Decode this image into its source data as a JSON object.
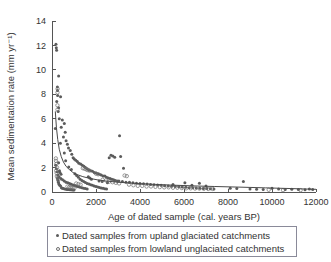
{
  "chart_data": {
    "type": "scatter",
    "title": "",
    "xlabel": "Age of dated sample (cal. years BP)",
    "ylabel": "Mean sedimentation rate (mm yr⁻¹)",
    "xlim": [
      0,
      12000
    ],
    "ylim": [
      0,
      14
    ],
    "xticks": [
      0,
      2000,
      4000,
      6000,
      8000,
      10000,
      12000
    ],
    "xticklabels": [
      "0",
      "2000",
      "4000",
      "6000",
      "8000",
      "10000",
      "12000"
    ],
    "yticks": [
      0,
      2,
      4,
      6,
      8,
      10,
      12,
      14
    ],
    "yticklabels": [
      "0",
      "2",
      "4",
      "6",
      "8",
      "10",
      "12",
      "14"
    ],
    "grid": false,
    "legend_position": "below-axes",
    "series": [
      {
        "name": "Dated samples from upland glaciated catchments",
        "marker": "filled-circle",
        "color": "#5b5b5b",
        "points": [
          [
            180,
            12.1
          ],
          [
            195,
            11.8
          ],
          [
            210,
            11.6
          ],
          [
            300,
            9.5
          ],
          [
            245,
            8.6
          ],
          [
            250,
            8.3
          ],
          [
            255,
            7.9
          ],
          [
            390,
            7.8
          ],
          [
            215,
            7.4
          ],
          [
            300,
            6.9
          ],
          [
            280,
            6.6
          ],
          [
            330,
            6.0
          ],
          [
            470,
            5.9
          ],
          [
            560,
            5.6
          ],
          [
            420,
            5.3
          ],
          [
            150,
            5.2
          ],
          [
            600,
            4.9
          ],
          [
            520,
            4.5
          ],
          [
            3070,
            4.6
          ],
          [
            640,
            4.2
          ],
          [
            380,
            4.0
          ],
          [
            700,
            3.9
          ],
          [
            750,
            3.6
          ],
          [
            830,
            3.4
          ],
          [
            560,
            3.2
          ],
          [
            900,
            3.1
          ],
          [
            2680,
            3.0
          ],
          [
            2760,
            2.95
          ],
          [
            2850,
            2.85
          ],
          [
            3120,
            2.9
          ],
          [
            2600,
            2.8
          ],
          [
            960,
            2.8
          ],
          [
            1010,
            2.7
          ],
          [
            1080,
            2.6
          ],
          [
            620,
            2.55
          ],
          [
            1150,
            2.5
          ],
          [
            300,
            2.4
          ],
          [
            1220,
            2.35
          ],
          [
            1300,
            2.3
          ],
          [
            170,
            2.2
          ],
          [
            1380,
            2.2
          ],
          [
            1450,
            2.1
          ],
          [
            760,
            2.05
          ],
          [
            1520,
            2.0
          ],
          [
            3250,
            1.95
          ],
          [
            200,
            1.9
          ],
          [
            1600,
            1.9
          ],
          [
            880,
            1.85
          ],
          [
            1680,
            1.8
          ],
          [
            1760,
            1.75
          ],
          [
            1840,
            1.7
          ],
          [
            240,
            1.65
          ],
          [
            1920,
            1.6
          ],
          [
            2000,
            1.55
          ],
          [
            1040,
            1.5
          ],
          [
            2080,
            1.5
          ],
          [
            2160,
            1.45
          ],
          [
            260,
            1.4
          ],
          [
            2240,
            1.4
          ],
          [
            1120,
            1.35
          ],
          [
            2320,
            1.3
          ],
          [
            2400,
            1.3
          ],
          [
            320,
            1.25
          ],
          [
            2480,
            1.2
          ],
          [
            1200,
            1.2
          ],
          [
            2560,
            1.15
          ],
          [
            2640,
            1.1
          ],
          [
            400,
            1.1
          ],
          [
            2720,
            1.05
          ],
          [
            1280,
            1.05
          ],
          [
            2800,
            1.0
          ],
          [
            480,
            1.0
          ],
          [
            2880,
            0.95
          ],
          [
            1360,
            0.95
          ],
          [
            2960,
            0.9
          ],
          [
            3040,
            0.9
          ],
          [
            560,
            0.9
          ],
          [
            3200,
            0.85
          ],
          [
            1440,
            0.85
          ],
          [
            3360,
            0.8
          ],
          [
            640,
            0.8
          ],
          [
            3520,
            0.8
          ],
          [
            1520,
            0.78
          ],
          [
            3680,
            0.75
          ],
          [
            720,
            0.75
          ],
          [
            3840,
            0.72
          ],
          [
            1600,
            0.7
          ],
          [
            4000,
            0.7
          ],
          [
            800,
            0.7
          ],
          [
            4160,
            0.68
          ],
          [
            1680,
            0.66
          ],
          [
            4320,
            0.65
          ],
          [
            880,
            0.64
          ],
          [
            4480,
            0.62
          ],
          [
            1760,
            0.6
          ],
          [
            4640,
            0.6
          ],
          [
            960,
            0.58
          ],
          [
            4800,
            0.57
          ],
          [
            1840,
            0.55
          ],
          [
            4960,
            0.55
          ],
          [
            1040,
            0.53
          ],
          [
            5120,
            0.52
          ],
          [
            1920,
            0.5
          ],
          [
            5280,
            0.5
          ],
          [
            1120,
            0.48
          ],
          [
            5440,
            0.47
          ],
          [
            2000,
            0.45
          ],
          [
            5600,
            0.45
          ],
          [
            1200,
            0.43
          ],
          [
            5760,
            0.42
          ],
          [
            2080,
            0.4
          ],
          [
            5920,
            0.4
          ],
          [
            1280,
            0.38
          ],
          [
            6080,
            0.38
          ],
          [
            2160,
            0.36
          ],
          [
            6240,
            0.35
          ],
          [
            1360,
            0.34
          ],
          [
            6400,
            0.34
          ],
          [
            2240,
            0.32
          ],
          [
            6560,
            0.32
          ],
          [
            1440,
            0.3
          ],
          [
            6720,
            0.3
          ],
          [
            2320,
            0.3
          ],
          [
            6880,
            0.28
          ],
          [
            1520,
            0.28
          ],
          [
            7040,
            0.28
          ],
          [
            2400,
            0.26
          ],
          [
            7200,
            0.26
          ],
          [
            1600,
            0.25
          ],
          [
            7360,
            0.25
          ],
          [
            2480,
            0.24
          ],
          [
            6040,
            0.75
          ],
          [
            6700,
            0.72
          ],
          [
            5500,
            0.62
          ],
          [
            6360,
            0.55
          ],
          [
            7000,
            0.5
          ],
          [
            8700,
            0.85
          ],
          [
            8100,
            0.3
          ],
          [
            8400,
            0.28
          ],
          [
            9000,
            0.25
          ],
          [
            9300,
            0.22
          ],
          [
            9600,
            0.2
          ],
          [
            10000,
            0.3
          ],
          [
            10300,
            0.25
          ],
          [
            10600,
            0.2
          ],
          [
            10900,
            0.22
          ],
          [
            11200,
            0.2
          ],
          [
            11500,
            0.18
          ],
          [
            11700,
            0.25
          ],
          [
            11850,
            0.2
          ],
          [
            430,
            0.35
          ],
          [
            470,
            0.3
          ],
          [
            520,
            0.28
          ],
          [
            580,
            0.25
          ],
          [
            650,
            0.22
          ],
          [
            700,
            0.2
          ],
          [
            760,
            0.2
          ],
          [
            820,
            0.18
          ],
          [
            880,
            0.18
          ],
          [
            940,
            0.16
          ],
          [
            1000,
            0.16
          ],
          [
            340,
            1.75
          ],
          [
            360,
            1.6
          ],
          [
            410,
            1.45
          ],
          [
            250,
            1.1
          ],
          [
            270,
            0.95
          ],
          [
            290,
            0.8
          ],
          [
            310,
            0.65
          ],
          [
            350,
            0.55
          ],
          [
            390,
            0.5
          ],
          [
            1650,
            1.25
          ],
          [
            1720,
            1.15
          ],
          [
            1790,
            1.05
          ],
          [
            2140,
            0.9
          ],
          [
            2280,
            0.85
          ],
          [
            2520,
            0.75
          ]
        ]
      },
      {
        "name": "Dated samples from lowland unglaciated catchments",
        "marker": "open-circle",
        "color": "#6e6e6e",
        "points": [
          [
            255,
            8.45
          ],
          [
            250,
            8.15
          ],
          [
            245,
            7.1
          ],
          [
            250,
            6.75
          ],
          [
            175,
            2.75
          ],
          [
            180,
            2.55
          ],
          [
            200,
            2.3
          ],
          [
            230,
            2.0
          ],
          [
            190,
            1.75
          ],
          [
            210,
            1.55
          ],
          [
            1400,
            1.95
          ],
          [
            1480,
            1.9
          ],
          [
            1560,
            1.85
          ],
          [
            1620,
            1.8
          ],
          [
            1700,
            1.75
          ],
          [
            2000,
            1.5
          ],
          [
            2100,
            1.45
          ],
          [
            3300,
            1.35
          ],
          [
            3400,
            1.3
          ],
          [
            220,
            1.3
          ],
          [
            260,
            1.15
          ],
          [
            300,
            1.0
          ],
          [
            2300,
            1.0
          ],
          [
            2450,
            0.95
          ],
          [
            2600,
            0.85
          ],
          [
            2750,
            0.8
          ],
          [
            2900,
            0.75
          ],
          [
            3050,
            0.7
          ],
          [
            1100,
            0.7
          ],
          [
            1200,
            0.65
          ],
          [
            1300,
            0.6
          ],
          [
            3500,
            0.6
          ],
          [
            3700,
            0.55
          ],
          [
            3900,
            0.5
          ],
          [
            4100,
            0.5
          ],
          [
            4300,
            0.45
          ],
          [
            4500,
            0.45
          ],
          [
            4700,
            0.42
          ],
          [
            4900,
            0.4
          ],
          [
            5100,
            0.38
          ],
          [
            5300,
            0.38
          ],
          [
            5500,
            0.35
          ],
          [
            5700,
            0.35
          ],
          [
            5900,
            0.32
          ],
          [
            6100,
            0.3
          ],
          [
            6300,
            0.3
          ],
          [
            6500,
            0.28
          ],
          [
            6700,
            0.28
          ],
          [
            6900,
            0.26
          ],
          [
            7100,
            0.25
          ],
          [
            7300,
            0.25
          ],
          [
            700,
            0.45
          ],
          [
            780,
            0.4
          ],
          [
            860,
            0.38
          ],
          [
            940,
            0.35
          ],
          [
            1020,
            0.32
          ],
          [
            9850,
            0.18
          ],
          [
            10500,
            0.15
          ],
          [
            11300,
            0.15
          ]
        ]
      }
    ],
    "fit_curve": {
      "description": "power-law decay fit through scatter",
      "points": [
        [
          150,
          6.6
        ],
        [
          200,
          5.3
        ],
        [
          260,
          4.3
        ],
        [
          330,
          3.5
        ],
        [
          420,
          2.9
        ],
        [
          520,
          2.45
        ],
        [
          640,
          2.1
        ],
        [
          780,
          1.85
        ],
        [
          950,
          1.6
        ],
        [
          1150,
          1.42
        ],
        [
          1400,
          1.26
        ],
        [
          1700,
          1.12
        ],
        [
          2050,
          1.0
        ],
        [
          2450,
          0.9
        ],
        [
          2900,
          0.82
        ],
        [
          3400,
          0.75
        ],
        [
          4000,
          0.68
        ],
        [
          4700,
          0.62
        ],
        [
          5500,
          0.56
        ],
        [
          6400,
          0.5
        ],
        [
          7400,
          0.45
        ],
        [
          8500,
          0.4
        ],
        [
          9700,
          0.34
        ],
        [
          10900,
          0.28
        ],
        [
          12000,
          0.22
        ]
      ]
    }
  },
  "legend": {
    "items": [
      {
        "marker": "filled-circle",
        "label": "Dated samples from upland glaciated catchments"
      },
      {
        "marker": "open-circle",
        "label": "Dated samples from lowland unglaciated catchments"
      }
    ]
  }
}
